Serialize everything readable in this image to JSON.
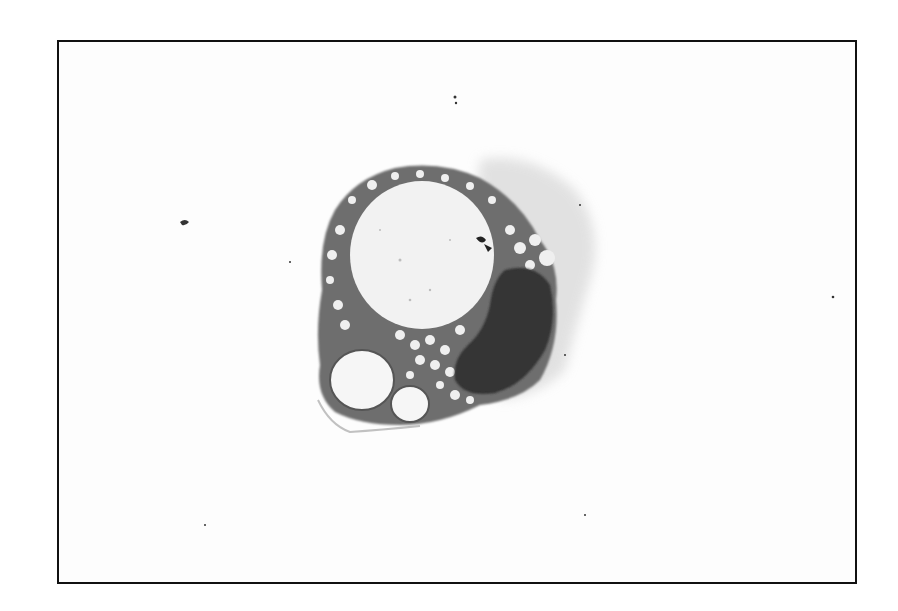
{
  "image": {
    "description": "Grayscale micrograph of a single cell with a large pale vacuole, a dark crescent-shaped nucleus, and a foamy vacuolated cytoplasm, framed by a thin black border",
    "colors": {
      "background": "#fdfdfd",
      "border": "#111111",
      "nucleus": "#2a2a2a",
      "cytoplasm": "#6a6a6a",
      "vacuole": "#f4f4f4",
      "halo": "#d8d8d8"
    }
  }
}
